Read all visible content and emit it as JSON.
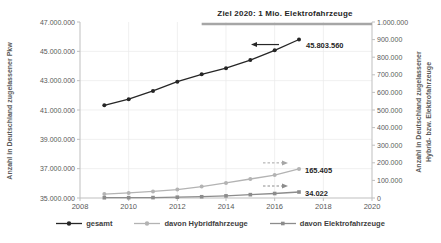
{
  "chart_data": {
    "type": "line",
    "title": "",
    "grid": true,
    "legend_position": "bottom",
    "annotation": {
      "text": "Ziel 2020: 1 Mio. Elektrofahrzeuge",
      "value": 1000000,
      "axis": "right",
      "x_start": 2013
    },
    "x": [
      2009,
      2010,
      2011,
      2012,
      2013,
      2014,
      2015,
      2016,
      2017
    ],
    "x_axis": {
      "range": [
        2008,
        2020
      ],
      "tick_values": [
        2008,
        2010,
        2012,
        2014,
        2016,
        2018,
        2020
      ],
      "tick_labels": [
        "2008",
        "2010",
        "2012",
        "2014",
        "2016",
        "2018",
        "2020"
      ]
    },
    "left_axis": {
      "label": "Anzahl in Deutschland zugelassener Pkw",
      "range": [
        35000000,
        47000000
      ],
      "tick_values": [
        35000000,
        37000000,
        39000000,
        41000000,
        43000000,
        45000000,
        47000000
      ],
      "tick_labels": [
        "35.000.000",
        "37.000.000",
        "39.000.000",
        "41.000.000",
        "43.000.000",
        "45.000.000",
        "47.000.000"
      ]
    },
    "right_axis": {
      "label_lines": [
        "Anzahl in Deutschland zugelassener",
        "Hybrid- bzw. Elektrofahrzeuge"
      ],
      "range": [
        0,
        1000000
      ],
      "tick_values": [
        0,
        100000,
        200000,
        300000,
        400000,
        500000,
        600000,
        700000,
        800000,
        900000,
        1000000
      ],
      "tick_labels": [
        "0",
        "100.000",
        "200.000",
        "300.000",
        "400.000",
        "500.000",
        "600.000",
        "700.000",
        "800.000",
        "900.000",
        "1.000.000"
      ]
    },
    "series": [
      {
        "id": "gesamt",
        "name": "gesamt",
        "axis": "left",
        "color": "#262626",
        "marker": "circle",
        "values": [
          41321171,
          41737627,
          42301563,
          42927647,
          43431124,
          43851230,
          44403124,
          45071209,
          45803560
        ],
        "callout": {
          "text": "45.803.560",
          "dir": "left",
          "style": "solid",
          "arrow_color": "#262626"
        }
      },
      {
        "id": "hybrid",
        "name": "davon Hybridfahrzeuge",
        "axis": "right",
        "color": "#b3b3b3",
        "marker": "circle",
        "values": [
          22330,
          28862,
          37256,
          47642,
          64995,
          85575,
          107754,
          130365,
          165405
        ],
        "callout": {
          "text": "165.405",
          "dir": "right",
          "style": "dashed",
          "arrow_color": "#a6a6a6"
        }
      },
      {
        "id": "elektro",
        "name": "davon Elektrofahrzeuge",
        "axis": "right",
        "color": "#8c8c8c",
        "marker": "square",
        "values": [
          1452,
          1588,
          2307,
          4541,
          7114,
          12156,
          18948,
          25502,
          34022
        ],
        "callout": {
          "text": "34.022",
          "dir": "right",
          "style": "dashed",
          "arrow_color": "#8c8c8c"
        }
      }
    ],
    "style": {
      "grid_color": "#e9e9e9",
      "axis_color": "#bfbfbf",
      "tick_text_color": "#595959",
      "target_line_color": "#a6a6a6",
      "label_text_color": "#262626",
      "background": "#ffffff"
    }
  }
}
